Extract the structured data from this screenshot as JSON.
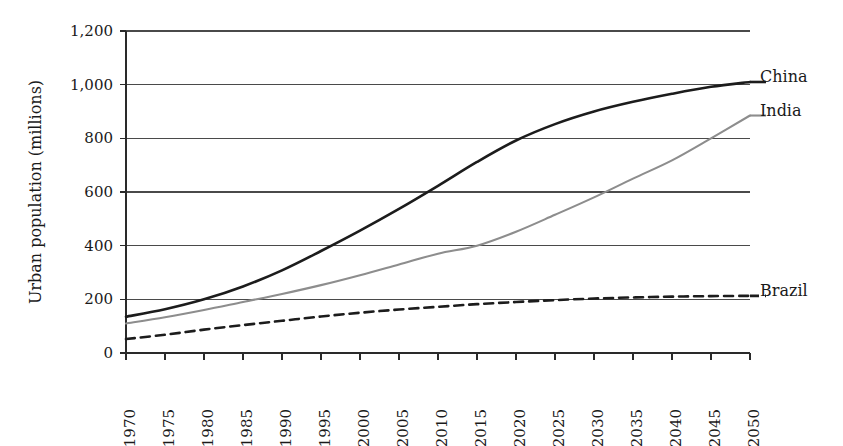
{
  "chart_data": {
    "type": "line",
    "title": "",
    "xlabel": "",
    "ylabel": "Urban population (millions)",
    "grid": true,
    "legend_position": "right-inline-end-of-line",
    "x": [
      1970,
      1975,
      1980,
      1985,
      1990,
      1995,
      2000,
      2005,
      2010,
      2015,
      2020,
      2025,
      2030,
      2035,
      2040,
      2045,
      2050
    ],
    "xtick_labels": [
      "1970",
      "1975",
      "1980",
      "1985",
      "1990",
      "1995",
      "2000",
      "2005",
      "2010",
      "2015",
      "2020",
      "2025",
      "2030",
      "2035",
      "2040",
      "2045",
      "2050"
    ],
    "ytick_labels": [
      "0",
      "200",
      "400",
      "600",
      "800",
      "1,000",
      "1,200"
    ],
    "ytick_values": [
      0,
      200,
      400,
      600,
      800,
      1000,
      1200
    ],
    "xlim": [
      1970,
      2050
    ],
    "ylim": [
      0,
      1200
    ],
    "series": [
      {
        "name": "China",
        "label": "China",
        "color": "#1c1c1c",
        "width": 2.6,
        "dash": "none",
        "values": [
          135,
          163,
          200,
          248,
          308,
          380,
          456,
          537,
          623,
          712,
          792,
          853,
          900,
          936,
          966,
          992,
          1010
        ]
      },
      {
        "name": "India",
        "label": "India",
        "color": "#8d8d8d",
        "width": 2.1,
        "dash": "none",
        "values": [
          110,
          133,
          160,
          190,
          220,
          253,
          290,
          330,
          370,
          400,
          452,
          515,
          580,
          650,
          718,
          800,
          885
        ]
      },
      {
        "name": "Brazil",
        "label": "Brazil",
        "color": "#1c1c1c",
        "width": 2.6,
        "dash": "9,6",
        "values": [
          52,
          68,
          87,
          104,
          120,
          136,
          150,
          162,
          172,
          182,
          190,
          197,
          203,
          207,
          210,
          212,
          213
        ]
      }
    ]
  },
  "layout": {
    "plot_left": 126,
    "plot_right": 750,
    "plot_top": 31,
    "plot_bottom": 353,
    "label_x": 760,
    "leader_len": 16
  }
}
